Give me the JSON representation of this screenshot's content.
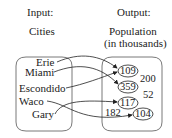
{
  "diagram": {
    "input_header": "Input:",
    "input_subheader": "Cities",
    "output_header": "Output:",
    "output_subheader_line1": "Population",
    "output_subheader_line2": "(in thousands)",
    "inputs": [
      "Erie",
      "Miami",
      "Escondido",
      "Waco",
      "Gary"
    ],
    "outputs": [
      "109",
      "200",
      "359",
      "52",
      "117",
      "182",
      "104"
    ],
    "circled_outputs": [
      "109",
      "359",
      "117",
      "104"
    ],
    "mappings": [
      {
        "from": "Erie",
        "to": "109"
      },
      {
        "from": "Miami",
        "to": "359"
      },
      {
        "from": "Escondido",
        "to": "109"
      },
      {
        "from": "Waco",
        "to": "104"
      },
      {
        "from": "Gary",
        "to": "117"
      }
    ]
  }
}
